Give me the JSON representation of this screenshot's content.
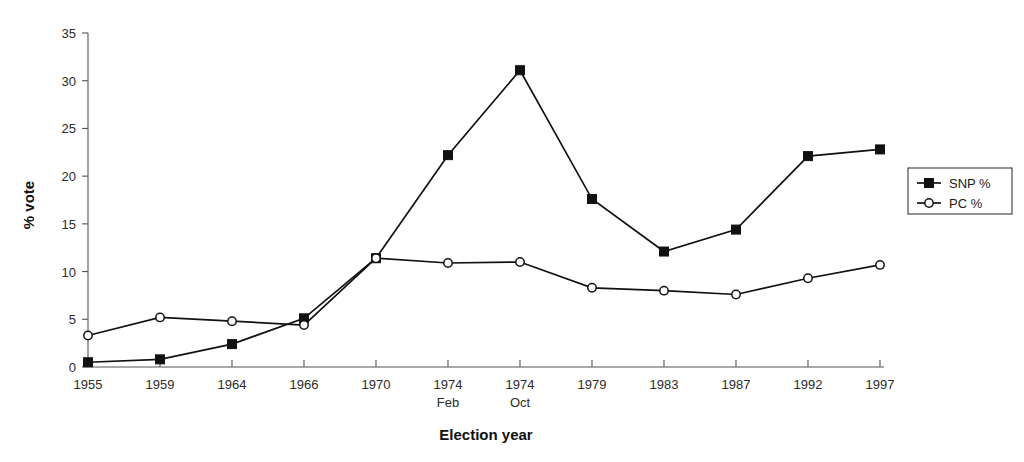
{
  "chart_data": {
    "type": "line",
    "title": "",
    "xlabel": "Election year",
    "ylabel": "% vote",
    "categories": [
      "1955",
      "1959",
      "1964",
      "1966",
      "1970",
      "1974 Feb",
      "1974 Oct",
      "1979",
      "1983",
      "1987",
      "1992",
      "1997"
    ],
    "category_lines": [
      [
        "1955",
        ""
      ],
      [
        "1959",
        ""
      ],
      [
        "1964",
        ""
      ],
      [
        "1966",
        ""
      ],
      [
        "1970",
        ""
      ],
      [
        "1974",
        "Feb"
      ],
      [
        "1974",
        "Oct"
      ],
      [
        "1979",
        ""
      ],
      [
        "1983",
        ""
      ],
      [
        "1987",
        ""
      ],
      [
        "1992",
        ""
      ],
      [
        "1997",
        ""
      ]
    ],
    "series": [
      {
        "name": "SNP %",
        "marker": "filled-square",
        "color": "#111111",
        "values": [
          0.5,
          0.8,
          2.4,
          5.1,
          11.4,
          22.2,
          31.1,
          17.6,
          12.1,
          14.4,
          22.1,
          22.8
        ]
      },
      {
        "name": "PC %",
        "marker": "open-circle",
        "color": "#111111",
        "values": [
          3.3,
          5.2,
          4.8,
          4.4,
          11.4,
          10.9,
          11.0,
          8.3,
          8.0,
          7.6,
          9.3,
          10.7
        ]
      }
    ],
    "ylim": [
      0,
      35
    ],
    "yticks": [
      0,
      5,
      10,
      15,
      20,
      25,
      30,
      35
    ],
    "ytick_labels": [
      "0",
      "5",
      "10",
      "15",
      "20",
      "25",
      "30",
      "35"
    ],
    "grid": false,
    "legend_position": "right"
  },
  "legend": {
    "entries": [
      {
        "label": "SNP %",
        "marker": "filled-square"
      },
      {
        "label": "PC %",
        "marker": "open-circle"
      }
    ]
  }
}
